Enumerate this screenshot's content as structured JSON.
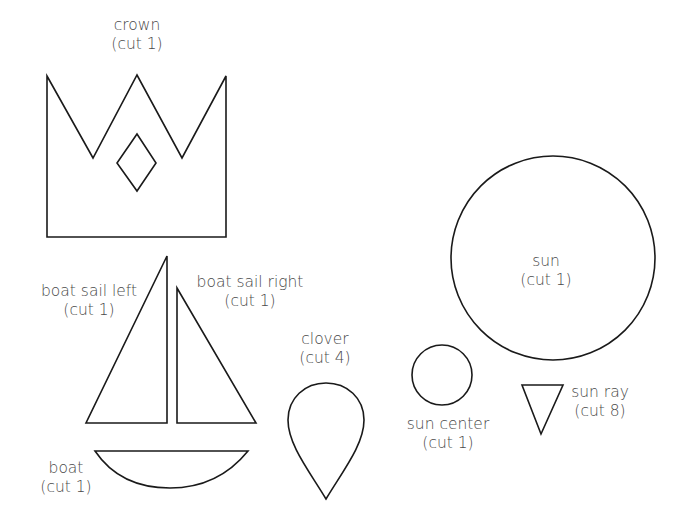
{
  "colors": {
    "stroke": "#1a1a1a",
    "text": "#4a4a4a",
    "background": "#ffffff"
  },
  "pieces": [
    {
      "id": "crown",
      "name": "crown",
      "count": "(cut 1)"
    },
    {
      "id": "boat-sail-left",
      "name": "boat sail left",
      "count": "(cut 1)"
    },
    {
      "id": "boat-sail-right",
      "name": "boat sail right",
      "count": "(cut 1)"
    },
    {
      "id": "boat",
      "name": "boat",
      "count": "(cut 1)"
    },
    {
      "id": "clover",
      "name": "clover",
      "count": "(cut 4)"
    },
    {
      "id": "sun-center",
      "name": "sun center",
      "count": "(cut 1)"
    },
    {
      "id": "sun",
      "name": "sun",
      "count": "(cut 1)"
    },
    {
      "id": "sun-ray",
      "name": "sun ray",
      "count": "(cut 8)"
    }
  ]
}
